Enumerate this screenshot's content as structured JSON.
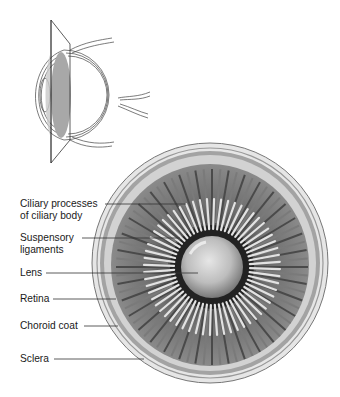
{
  "figure": {
    "inset": {
      "description": "Sagittal eye outline with coronal cutting plane"
    },
    "main_view": {
      "description": "Frontal section of eye showing lens and ciliary body"
    },
    "colors": {
      "background": "#ffffff",
      "line": "#333333",
      "sclera": "#e4e4e4",
      "choroid": "#9a9a9a",
      "retina_band": "#cfcfcf",
      "ciliary_dark": "#5a5a5a",
      "ligament_light": "#d8d8d8",
      "lens": "#c9c9c9",
      "plane_fill": "#b0b0b0"
    },
    "labels": [
      {
        "id": "ciliary",
        "lines": [
          "Ciliary processes",
          "of ciliary body"
        ]
      },
      {
        "id": "suspensory",
        "lines": [
          "Suspensory",
          "ligaments"
        ]
      },
      {
        "id": "lens",
        "lines": [
          "Lens"
        ]
      },
      {
        "id": "retina",
        "lines": [
          "Retina"
        ]
      },
      {
        "id": "choroid",
        "lines": [
          "Choroid coat"
        ]
      },
      {
        "id": "sclera",
        "lines": [
          "Sclera"
        ]
      }
    ]
  }
}
